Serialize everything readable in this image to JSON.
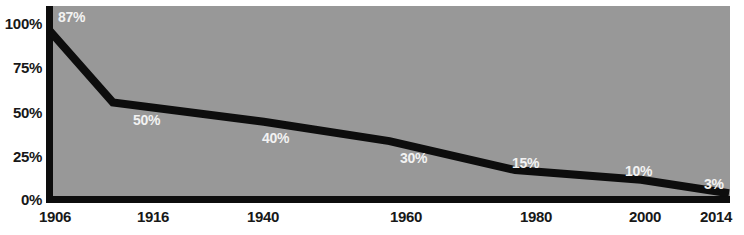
{
  "chart_data": {
    "type": "line",
    "title": "",
    "subtitle": "",
    "xlabel": "",
    "ylabel": "",
    "x": [
      1906,
      1916,
      1940,
      1960,
      1980,
      2000,
      2014
    ],
    "categories": [
      "1906",
      "1916",
      "1940",
      "1960",
      "1980",
      "2000",
      "2014"
    ],
    "values": [
      87,
      50,
      40,
      30,
      15,
      10,
      3
    ],
    "point_labels": [
      "87%",
      "50%",
      "40%",
      "30%",
      "15%",
      "10%",
      "3%"
    ],
    "ylim": [
      0,
      100
    ],
    "xlim": [
      1906,
      2014
    ],
    "ytick_labels": [
      "100%",
      "75%",
      "50%",
      "25%",
      "0%"
    ],
    "ytick_values": [
      100,
      75,
      50,
      25,
      0
    ],
    "xtick_labels": [
      "1906",
      "1916",
      "1940",
      "1960",
      "1980",
      "2000",
      "2014"
    ],
    "grid": false,
    "legend": false,
    "legend_position": "none",
    "series": [
      {
        "name": "",
        "values": [
          87,
          50,
          40,
          30,
          15,
          10,
          3
        ]
      }
    ],
    "colors": {
      "plot_background": "#989898",
      "page_background": "#ffffff",
      "line": "#0d0d0d",
      "axis": "#0d0d0d",
      "tick_label": "#181818",
      "point_label": "#f2f2f2"
    }
  },
  "axis": {
    "y_ticks": [
      {
        "label": "100%",
        "value": 100
      },
      {
        "label": "75%",
        "value": 75
      },
      {
        "label": "50%",
        "value": 50
      },
      {
        "label": "25%",
        "value": 25
      },
      {
        "label": "0%",
        "value": 0
      }
    ],
    "x_ticks": [
      {
        "label": "1906",
        "value": 1906
      },
      {
        "label": "1916",
        "value": 1916
      },
      {
        "label": "1940",
        "value": 1940
      },
      {
        "label": "1960",
        "value": 1960
      },
      {
        "label": "1980",
        "value": 1980
      },
      {
        "label": "2000",
        "value": 2000
      },
      {
        "label": "2014",
        "value": 2014
      }
    ]
  },
  "points": [
    {
      "label": "87%",
      "x": 1906,
      "y": 87
    },
    {
      "label": "50%",
      "x": 1916,
      "y": 50
    },
    {
      "label": "40%",
      "x": 1940,
      "y": 40
    },
    {
      "label": "30%",
      "x": 1960,
      "y": 30
    },
    {
      "label": "15%",
      "x": 1980,
      "y": 15
    },
    {
      "label": "10%",
      "x": 2000,
      "y": 10
    },
    {
      "label": "3%",
      "x": 2014,
      "y": 3
    }
  ]
}
